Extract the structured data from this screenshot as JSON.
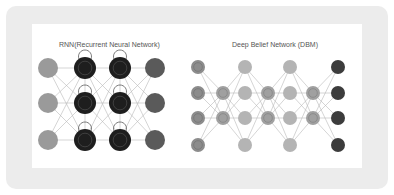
{
  "diagrams": [
    {
      "title": "RNN(Recurrent Neural Network)",
      "title_pos": [
        59,
        46
      ],
      "columns_x": [
        48,
        85,
        120,
        155
      ],
      "rows_y": [
        68,
        103,
        140
      ],
      "node_radius": 10,
      "layers": [
        "input",
        "hidden",
        "hidden",
        "output"
      ],
      "colors": {
        "input": "#9a9a9a",
        "hidden": "#2e2e2e",
        "output": "#5a5a5a"
      }
    },
    {
      "title": "Deep Belief Network (DBM)",
      "title_pos": [
        232,
        46
      ],
      "node_radius": 7,
      "colors": {
        "visible": "#8c8c8c",
        "hidden_small": "#a0a0a0",
        "hidden": "#b4b4b4",
        "output": "#3c3c3c"
      }
    }
  ]
}
